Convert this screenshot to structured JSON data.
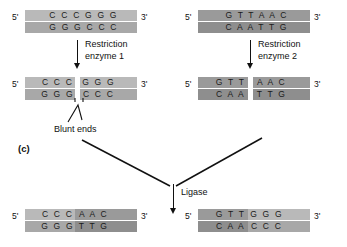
{
  "figure": {
    "panel_letter": "(c)",
    "five_prime": "5'",
    "three_prime": "3'"
  },
  "labels": {
    "enzyme1_line1": "Restriction",
    "enzyme1_line2": "enzyme 1",
    "enzyme2_line1": "Restriction",
    "enzyme2_line2": "enzyme 2",
    "blunt_ends": "Blunt ends",
    "ligase": "Ligase"
  },
  "molecules": {
    "left_uncut": {
      "top_strand": "C C C G G G",
      "bottom_strand": "G G G C C C",
      "shade": "light"
    },
    "right_uncut": {
      "top_strand": "G T T A A C",
      "bottom_strand": "C A A T T G",
      "shade": "dark"
    },
    "left_cut": {
      "top_left": "C C C",
      "top_right": "G G G",
      "bottom_left": "G G G",
      "bottom_right": "C C C",
      "shade": "light"
    },
    "right_cut": {
      "top_left": "G T T",
      "top_right": "A A C",
      "bottom_left": "C A A",
      "bottom_right": "T T G",
      "shade": "dark"
    },
    "product_left": {
      "top_left": "C C C",
      "top_right": "A A C",
      "bottom_left": "G G G",
      "bottom_right": "T T G"
    },
    "product_right": {
      "top_left": "G T T",
      "top_right": "G G G",
      "bottom_left": "C A A",
      "bottom_right": "C C C"
    }
  },
  "colors": {
    "light_top": "#b9b9b9",
    "light_bottom": "#a8a8a8",
    "dark_top": "#9a9a9a",
    "dark_bottom": "#8e8e8e",
    "ink": "#111111"
  }
}
